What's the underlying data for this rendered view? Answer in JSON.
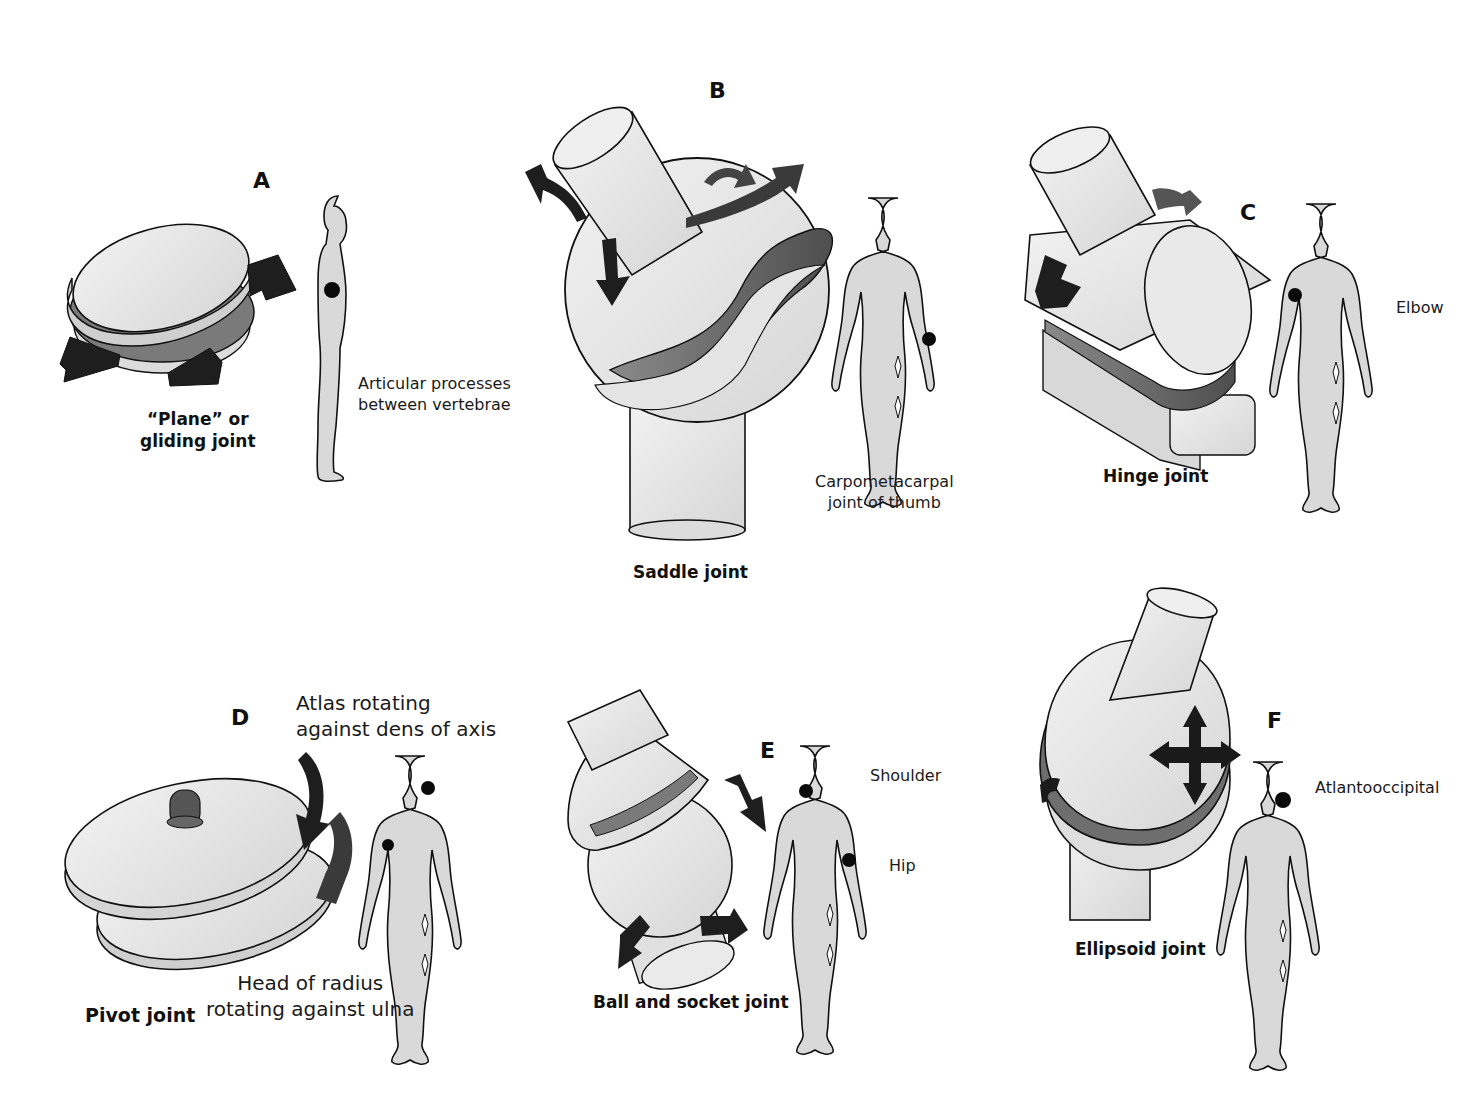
{
  "figure": {
    "colors": {
      "bone_fill": "#e6e6e6",
      "cartilage_fill": "#6e6e6e",
      "arrow_fill": "#1e1e1e",
      "body_fill": "#d9d9d9",
      "outline": "#111111",
      "marker": "#0a0a0a"
    },
    "panels": [
      {
        "letter": "A",
        "joint_type_lines": [
          "“Plane” or",
          "gliding joint"
        ],
        "example_lines": [
          "Articular processes",
          "between vertebrae"
        ],
        "body_view": "side",
        "marker_location": "lower back"
      },
      {
        "letter": "B",
        "joint_type_lines": [
          "Saddle joint"
        ],
        "example_lines": [
          "Carpometacarpal",
          "joint of thumb"
        ],
        "body_view": "front",
        "marker_location": "thumb"
      },
      {
        "letter": "C",
        "joint_type_lines": [
          "Hinge joint"
        ],
        "example_lines": [
          "Elbow"
        ],
        "body_view": "front",
        "marker_location": "elbow"
      },
      {
        "letter": "D",
        "joint_type_lines": [
          "Pivot joint"
        ],
        "example_lines": [
          "Atlas rotating",
          "against dens of axis"
        ],
        "example2_lines": [
          "Head of radius",
          "rotating against ulna"
        ],
        "body_view": "front",
        "marker_location": "neck and elbow"
      },
      {
        "letter": "E",
        "joint_type_lines": [
          "Ball and socket joint"
        ],
        "example_lines": [
          "Shoulder"
        ],
        "example2_lines": [
          "Hip"
        ],
        "body_view": "front",
        "marker_location": "shoulder and hip"
      },
      {
        "letter": "F",
        "joint_type_lines": [
          "Ellipsoid joint"
        ],
        "example_lines": [
          "Atlantooccipital"
        ],
        "body_view": "front",
        "marker_location": "neck"
      }
    ]
  }
}
